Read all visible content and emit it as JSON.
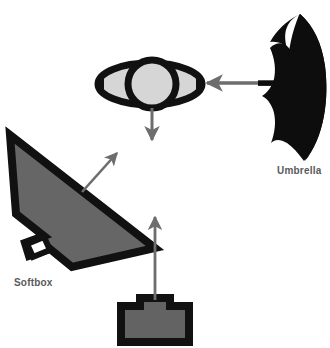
{
  "diagram": {
    "type": "lighting-diagram",
    "background_color": "#ffffff",
    "colors": {
      "outline": "#111111",
      "umbrella_fill": "#0d0d0d",
      "softbox_fill": "#666666",
      "flash_fill": "#636363",
      "lens_fill": "#d6d6d6",
      "arrow": "#6d6d6d",
      "label_text": "#5a5a5a"
    },
    "labels": [
      {
        "id": "umbrella",
        "text": "Umbrella"
      },
      {
        "id": "softbox",
        "text": "Softbox"
      }
    ],
    "elements": [
      {
        "id": "subject-eye",
        "name": "eye-lens-subject"
      },
      {
        "id": "umbrella",
        "name": "umbrella-light"
      },
      {
        "id": "softbox",
        "name": "softbox-light"
      },
      {
        "id": "flash",
        "name": "flash-strobe-unit"
      }
    ],
    "arrows": [
      {
        "id": "umbrella-arrow",
        "direction": "left",
        "from": "umbrella",
        "to": "subject-eye"
      },
      {
        "id": "softbox-arrow",
        "direction": "up-right",
        "from": "softbox",
        "to": "subject-eye"
      },
      {
        "id": "flash-arrow",
        "direction": "up",
        "from": "flash",
        "to": "subject-eye"
      },
      {
        "id": "subject-arrow",
        "direction": "down",
        "from": "subject-eye",
        "to": "viewer"
      }
    ]
  }
}
